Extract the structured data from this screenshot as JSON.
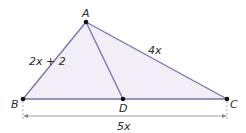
{
  "diagram": {
    "type": "triangle",
    "points": {
      "A": {
        "label": "A",
        "x": 86,
        "y": 22
      },
      "B": {
        "label": "B",
        "x": 23,
        "y": 99
      },
      "C": {
        "label": "C",
        "x": 227,
        "y": 99
      },
      "D": {
        "label": "D",
        "x": 123,
        "y": 99
      }
    },
    "sides": {
      "AB": {
        "label": "2x + 2"
      },
      "AC": {
        "label": "4x"
      },
      "BC": {
        "label": "5x"
      }
    },
    "segments": [
      "AB",
      "AC",
      "BC",
      "AD"
    ],
    "colors": {
      "line": "#7b6fa8",
      "fill": "#f1eef8",
      "point": "#111111",
      "dimension": "#888888"
    }
  }
}
